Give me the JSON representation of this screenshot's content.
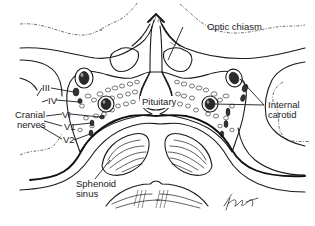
{
  "figure": {
    "labels": {
      "optic_chiasm": "Optic chiasm",
      "pituitary": "Pituitary",
      "internal_carotid_line1": "Internal",
      "internal_carotid_line2": "carotid",
      "cranial_nerves_line1": "Cranial",
      "cranial_nerves_line2": "nerves",
      "nerve_III": "III",
      "nerve_IV": "IV",
      "nerve_VI": "VI",
      "nerve_V1": "V1",
      "nerve_V2": "V2",
      "sphenoid_sinus_line1": "Sphenoid",
      "sphenoid_sinus_line2": "sinus"
    },
    "signature": "artist signature",
    "colors": {
      "ink": "#1a1a1a",
      "background": "#ffffff"
    }
  }
}
